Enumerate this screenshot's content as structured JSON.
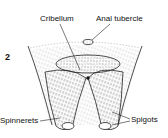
{
  "figure": {
    "number": "2",
    "labels": {
      "cribellum": "Cribellum",
      "anal_tubercle": "Anal tubercle",
      "spinnerets": "Spinnerets",
      "spigots": "Spigots"
    },
    "colors": {
      "ink": "#111111",
      "background": "#ffffff"
    }
  }
}
